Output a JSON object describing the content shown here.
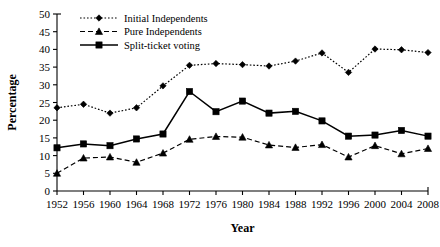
{
  "chart_data": {
    "type": "line",
    "title": "",
    "xlabel": "Year",
    "ylabel": "Percentage",
    "categories": [
      1952,
      1956,
      1960,
      1964,
      1968,
      1972,
      1976,
      1980,
      1984,
      1988,
      1992,
      1996,
      2000,
      2004,
      2008
    ],
    "x": [
      1952,
      1956,
      1960,
      1964,
      1968,
      1972,
      1976,
      1980,
      1984,
      1988,
      1992,
      1996,
      2000,
      2004,
      2008
    ],
    "xlim": [
      1952,
      2008
    ],
    "ylim": [
      0,
      50
    ],
    "yticks": [
      0,
      5,
      10,
      15,
      20,
      25,
      30,
      35,
      40,
      45,
      50
    ],
    "grid": false,
    "legend_position": "top-center",
    "series": [
      {
        "name": "Initial Independents",
        "line_style": "dotted",
        "marker": "diamond",
        "color": "#000000",
        "values": [
          23.5,
          24.5,
          22.0,
          23.5,
          29.7,
          35.5,
          36.0,
          35.7,
          35.3,
          36.7,
          39.0,
          33.5,
          40.1,
          39.9,
          39.1
        ]
      },
      {
        "name": "Pure Independents",
        "line_style": "dashed",
        "marker": "triangle",
        "color": "#000000",
        "values": [
          5.0,
          9.3,
          9.6,
          8.1,
          10.7,
          14.6,
          15.4,
          15.2,
          13.0,
          12.3,
          13.1,
          9.6,
          12.8,
          10.5,
          12.0
        ]
      },
      {
        "name": "Split-ticket voting",
        "line_style": "solid",
        "marker": "square",
        "color": "#000000",
        "values": [
          12.2,
          13.3,
          12.8,
          14.7,
          16.1,
          28.1,
          22.4,
          25.4,
          22.0,
          22.5,
          19.8,
          15.5,
          15.8,
          17.1,
          15.5
        ]
      }
    ]
  },
  "axis": {
    "y_title": "Percentage",
    "x_title": "Year"
  }
}
